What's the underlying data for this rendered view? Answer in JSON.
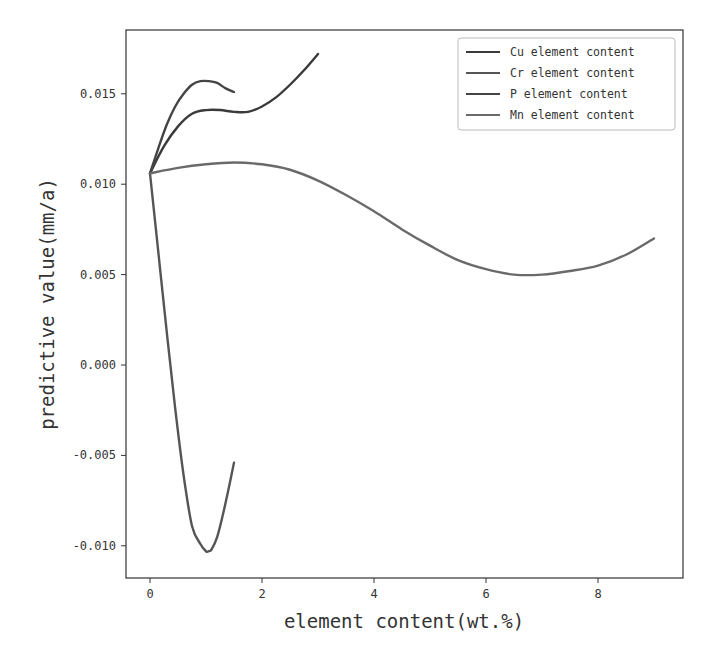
{
  "chart_data": {
    "type": "line",
    "title": "",
    "xlabel": "element content(wt.%)",
    "ylabel": "predictive value(mm/a)",
    "xlim": [
      -0.45,
      9.5
    ],
    "ylim": [
      -0.0117,
      0.0186
    ],
    "xticks": [
      0,
      2,
      4,
      6,
      8
    ],
    "xtick_labels": [
      "0",
      "2",
      "4",
      "6",
      "8"
    ],
    "yticks": [
      -0.01,
      -0.005,
      0.0,
      0.005,
      0.01,
      0.015
    ],
    "ytick_labels": [
      "-0.010",
      "-0.005",
      "0.000",
      "0.005",
      "0.010",
      "0.015"
    ],
    "grid": false,
    "legend_position": "upper right",
    "series": [
      {
        "name": "Cu element content",
        "color": "#3a3a3a",
        "x": [
          0,
          0.25,
          0.5,
          0.75,
          1.0,
          1.25,
          1.5,
          1.75,
          2.0,
          2.25,
          2.5,
          2.75,
          3.0
        ],
        "y": [
          0.0106,
          0.0121,
          0.0132,
          0.0139,
          0.0141,
          0.0141,
          0.014,
          0.014,
          0.0143,
          0.0148,
          0.0155,
          0.0163,
          0.0172
        ]
      },
      {
        "name": "Cr element content",
        "color": "#555555",
        "x": [
          0,
          0.15,
          0.3,
          0.45,
          0.6,
          0.75,
          0.9,
          1.0,
          1.05,
          1.1,
          1.2,
          1.3,
          1.4,
          1.5
        ],
        "y": [
          0.0106,
          0.0062,
          0.0018,
          -0.0024,
          -0.0061,
          -0.0089,
          -0.0099,
          -0.0103,
          -0.0103,
          -0.0102,
          -0.0095,
          -0.0083,
          -0.0069,
          -0.0054
        ]
      },
      {
        "name": "P element content",
        "color": "#444444",
        "x": [
          0,
          0.15,
          0.3,
          0.45,
          0.6,
          0.75,
          0.9,
          1.05,
          1.2,
          1.35,
          1.5
        ],
        "y": [
          0.0106,
          0.012,
          0.0133,
          0.0143,
          0.015,
          0.0155,
          0.0157,
          0.0157,
          0.0156,
          0.0153,
          0.0151
        ]
      },
      {
        "name": "Mn element content",
        "color": "#6a6a6a",
        "x": [
          0,
          0.5,
          1.0,
          1.5,
          2.0,
          2.5,
          3.0,
          3.5,
          4.0,
          4.5,
          5.0,
          5.5,
          6.0,
          6.5,
          7.0,
          7.5,
          8.0,
          8.5,
          9.0
        ],
        "y": [
          0.0106,
          0.0109,
          0.0111,
          0.0112,
          0.0111,
          0.0108,
          0.0102,
          0.0094,
          0.0085,
          0.0075,
          0.0066,
          0.0058,
          0.0053,
          0.005,
          0.005,
          0.0052,
          0.0055,
          0.0061,
          0.007
        ]
      }
    ]
  }
}
